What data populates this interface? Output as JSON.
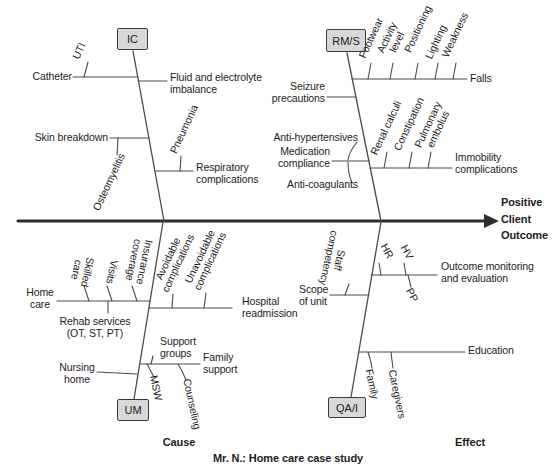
{
  "caption": "Mr. N.: Home care case study",
  "axis": {
    "cause": "Cause",
    "effect": "Effect",
    "outcome": "Positive\nClient\nOutcome"
  },
  "boxes": {
    "ic": "IC",
    "rms": "RM/S",
    "um": "UM",
    "qai": "QA/I"
  },
  "labels": {
    "catheter": "Catheter",
    "uti": "UTI",
    "fluid": "Fluid and electrolyte\nimbalance",
    "skin_breakdown": "Skin breakdown",
    "osteomyelitis": "Osteomyelitis",
    "pneumonia": "Pneumonia",
    "respiratory": "Respiratory\ncomplications",
    "seizure": "Seizure\nprecautions",
    "footwear": "Footwear",
    "activity_level": "Activity\nlevel",
    "positioning": "Positioning",
    "lighting": "Lighting",
    "weakness": "Weakness",
    "falls": "Falls",
    "anti_hypertensives": "Anti-hypertensives",
    "medication_compliance": "Medication\ncompliance",
    "anti_coagulants": "Anti-coagulants",
    "renal_calculi": "Renal calculi",
    "constipation": "Constipation",
    "pulmonary_embolus": "Pulmonary\nembolus",
    "immobility": "Immobility\ncomplications",
    "home_care": "Home\ncare",
    "skilled_care": "Skilled\ncare",
    "visits": "Visits",
    "insurance_coverage": "Insurance\ncoverage",
    "rehab_services": "Rehab services\n(OT, ST, PT)",
    "avoidable": "Avoidable\ncomplications",
    "unavoidable": "Unavoidable\ncomplications",
    "hospital_readmission": "Hospital\nreadmission",
    "support_groups": "Support\ngroups",
    "family_support": "Family\nsupport",
    "nursing_home": "Nursing\nhome",
    "msw": "MSW",
    "counseling": "Counseling",
    "scope_of_unit": "Scope\nof unit",
    "staff_competency": "Staff\ncompetency",
    "hr": "HR",
    "hv": "HV",
    "pp": "PP",
    "outcome_monitoring": "Outcome monitoring\nand evaluation",
    "education": "Education",
    "family": "Family",
    "caregivers": "Caregivers"
  },
  "colors": {
    "background": "#ffffff",
    "text": "#1c1c1c",
    "line": "#4a4a4a",
    "spine": "#2d2d2d",
    "box_fill": "#d8d8d8",
    "box_border": "#3a3a3a"
  }
}
